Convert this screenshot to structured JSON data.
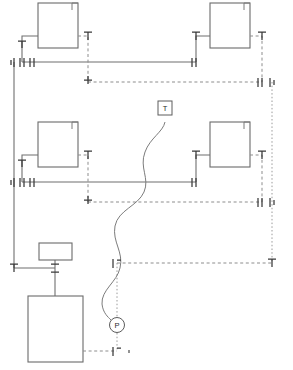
{
  "diagram": {
    "background_color": "#ffffff",
    "line_color": "#6f6f6f",
    "signal_color": "#8d8d8d",
    "valve_color": "#3a3a3a",
    "width": 293,
    "height": 370
  },
  "instruments": [
    {
      "tag": "T",
      "name": "temperature-indicator",
      "shape": "square",
      "x": 165,
      "y": 108,
      "size": 14
    },
    {
      "tag": "P",
      "name": "pressure-indicator",
      "shape": "circle",
      "x": 117,
      "y": 325,
      "radius": 7.5
    }
  ],
  "vessels": [
    {
      "name": "vessel-top-left",
      "label": "",
      "x": 38,
      "y": 3,
      "w": 40,
      "h": 45
    },
    {
      "name": "vessel-top-right",
      "label": "",
      "x": 210,
      "y": 3,
      "w": 40,
      "h": 45
    },
    {
      "name": "vessel-middle-left",
      "label": "",
      "x": 38,
      "y": 122,
      "w": 40,
      "h": 45
    },
    {
      "name": "vessel-middle-right",
      "label": "",
      "x": 210,
      "y": 122,
      "w": 40,
      "h": 45
    },
    {
      "name": "vessel-bottom-main",
      "label": "",
      "x": 28,
      "y": 296,
      "w": 55,
      "h": 66
    },
    {
      "name": "equipment-small-box",
      "label": "",
      "x": 39,
      "y": 243,
      "w": 33,
      "h": 17
    }
  ],
  "valves": [
    {
      "name": "valve-tl-inlet",
      "x": 22,
      "y": 44,
      "orientation": "vertical"
    },
    {
      "name": "valve-tl-header-a",
      "x": 14,
      "y": 62,
      "orientation": "vertical"
    },
    {
      "name": "valve-tl-header-b",
      "x": 22,
      "y": 62,
      "orientation": "vertical"
    },
    {
      "name": "valve-tl-header-c",
      "x": 30,
      "y": 62,
      "orientation": "vertical"
    },
    {
      "name": "valve-tl-outlet",
      "x": 88,
      "y": 44,
      "orientation": "vertical"
    },
    {
      "name": "valve-tl-drop",
      "x": 88,
      "y": 82,
      "orientation": "horizontal"
    },
    {
      "name": "valve-tr-inlet",
      "x": 196,
      "y": 44,
      "orientation": "vertical"
    },
    {
      "name": "valve-tr-header",
      "x": 196,
      "y": 62,
      "orientation": "vertical"
    },
    {
      "name": "valve-tr-outlet",
      "x": 262,
      "y": 44,
      "orientation": "vertical"
    },
    {
      "name": "valve-tr-corner-a",
      "x": 262,
      "y": 82,
      "orientation": "vertical"
    },
    {
      "name": "valve-tr-corner-b",
      "x": 272,
      "y": 82,
      "orientation": "vertical"
    },
    {
      "name": "valve-ml-inlet",
      "x": 22,
      "y": 163,
      "orientation": "vertical"
    },
    {
      "name": "valve-ml-header-a",
      "x": 14,
      "y": 182,
      "orientation": "vertical"
    },
    {
      "name": "valve-ml-header-b",
      "x": 22,
      "y": 182,
      "orientation": "vertical"
    },
    {
      "name": "valve-ml-header-c",
      "x": 30,
      "y": 182,
      "orientation": "vertical"
    },
    {
      "name": "valve-ml-outlet",
      "x": 88,
      "y": 163,
      "orientation": "vertical"
    },
    {
      "name": "valve-ml-drop",
      "x": 88,
      "y": 202,
      "orientation": "horizontal"
    },
    {
      "name": "valve-mr-inlet",
      "x": 196,
      "y": 163,
      "orientation": "vertical"
    },
    {
      "name": "valve-mr-header",
      "x": 196,
      "y": 182,
      "orientation": "vertical"
    },
    {
      "name": "valve-mr-outlet",
      "x": 262,
      "y": 163,
      "orientation": "vertical"
    },
    {
      "name": "valve-mr-corner-a",
      "x": 262,
      "y": 202,
      "orientation": "vertical"
    },
    {
      "name": "valve-mr-corner-b",
      "x": 272,
      "y": 202,
      "orientation": "vertical"
    },
    {
      "name": "valve-lower-left",
      "x": 14,
      "y": 268,
      "orientation": "vertical"
    },
    {
      "name": "valve-feed-tee",
      "x": 55,
      "y": 268,
      "orientation": "vertical"
    },
    {
      "name": "valve-signal-branch",
      "x": 117,
      "y": 263,
      "orientation": "vertical"
    },
    {
      "name": "valve-right-lower",
      "x": 272,
      "y": 262,
      "orientation": "vertical"
    },
    {
      "name": "valve-bottom-drain",
      "x": 117,
      "y": 351,
      "orientation": "vertical"
    }
  ],
  "legend": {
    "process_line_style": "solid",
    "signal_line_style": "dashed",
    "capillary_style": "curved-solid"
  }
}
